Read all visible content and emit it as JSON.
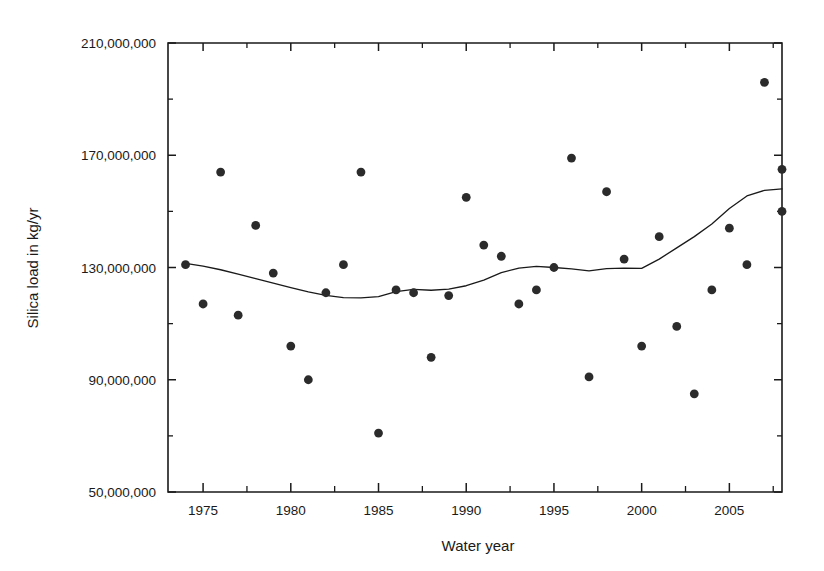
{
  "chart_data": {
    "type": "scatter",
    "title": "",
    "xlabel": "Water year",
    "ylabel": "Silica load in kg/yr",
    "xlim": [
      1973,
      2008
    ],
    "ylim": [
      50000000,
      210000000
    ],
    "grid": false,
    "legend": "none",
    "x_ticks": [
      1975,
      1980,
      1985,
      1990,
      1995,
      2000,
      2005
    ],
    "x_tick_labels": [
      "1975",
      "1980",
      "1985",
      "1990",
      "1995",
      "2000",
      "2005"
    ],
    "x_minor_ticks": [
      1977.5,
      1982.5,
      1987.5,
      1992.5,
      1997.5,
      2002.5,
      2007.5
    ],
    "y_ticks": [
      50000000,
      90000000,
      130000000,
      170000000,
      210000000
    ],
    "y_tick_labels": [
      "50,000,000",
      "90,000,000",
      "130,000,000",
      "170,000,000",
      "210,000,000"
    ],
    "y_minor_ticks": [
      70000000,
      110000000,
      150000000,
      190000000
    ],
    "point_color": "#2b2b2b",
    "line_color": "#1a1a1a",
    "series": [
      {
        "name": "Annual silica load",
        "type": "scatter",
        "points": [
          {
            "x": 1974,
            "y": 131000000
          },
          {
            "x": 1975,
            "y": 117000000
          },
          {
            "x": 1976,
            "y": 164000000
          },
          {
            "x": 1977,
            "y": 113000000
          },
          {
            "x": 1978,
            "y": 145000000
          },
          {
            "x": 1979,
            "y": 128000000
          },
          {
            "x": 1980,
            "y": 102000000
          },
          {
            "x": 1981,
            "y": 90000000
          },
          {
            "x": 1982,
            "y": 121000000
          },
          {
            "x": 1983,
            "y": 131000000
          },
          {
            "x": 1984,
            "y": 164000000
          },
          {
            "x": 1985,
            "y": 71000000
          },
          {
            "x": 1986,
            "y": 122000000
          },
          {
            "x": 1987,
            "y": 121000000
          },
          {
            "x": 1988,
            "y": 98000000
          },
          {
            "x": 1989,
            "y": 120000000
          },
          {
            "x": 1990,
            "y": 155000000
          },
          {
            "x": 1991,
            "y": 138000000
          },
          {
            "x": 1992,
            "y": 134000000
          },
          {
            "x": 1993,
            "y": 117000000
          },
          {
            "x": 1994,
            "y": 122000000
          },
          {
            "x": 1995,
            "y": 130000000
          },
          {
            "x": 1996,
            "y": 169000000
          },
          {
            "x": 1997,
            "y": 91000000
          },
          {
            "x": 1998,
            "y": 157000000
          },
          {
            "x": 1999,
            "y": 133000000
          },
          {
            "x": 2000,
            "y": 102000000
          },
          {
            "x": 2001,
            "y": 141000000
          },
          {
            "x": 2002,
            "y": 109000000
          },
          {
            "x": 2003,
            "y": 85000000
          },
          {
            "x": 2004,
            "y": 122000000
          },
          {
            "x": 2005,
            "y": 144000000
          },
          {
            "x": 2006,
            "y": 131000000
          },
          {
            "x": 2007,
            "y": 196000000
          },
          {
            "x": 2008,
            "y": 150000000
          },
          {
            "x": 2008,
            "y": 165000000
          }
        ]
      },
      {
        "name": "Smoothed trend",
        "type": "line",
        "points": [
          {
            "x": 1974.0,
            "y": 131500000
          },
          {
            "x": 1975.0,
            "y": 130500000
          },
          {
            "x": 1976.0,
            "y": 129200000
          },
          {
            "x": 1977.0,
            "y": 127600000
          },
          {
            "x": 1978.0,
            "y": 126000000
          },
          {
            "x": 1979.0,
            "y": 124400000
          },
          {
            "x": 1980.0,
            "y": 122800000
          },
          {
            "x": 1981.0,
            "y": 121300000
          },
          {
            "x": 1982.0,
            "y": 120100000
          },
          {
            "x": 1983.0,
            "y": 119300000
          },
          {
            "x": 1984.0,
            "y": 119200000
          },
          {
            "x": 1985.0,
            "y": 119600000
          },
          {
            "x": 1986.0,
            "y": 121400000
          },
          {
            "x": 1987.0,
            "y": 122200000
          },
          {
            "x": 1988.0,
            "y": 121900000
          },
          {
            "x": 1989.0,
            "y": 122300000
          },
          {
            "x": 1990.0,
            "y": 123500000
          },
          {
            "x": 1991.0,
            "y": 125500000
          },
          {
            "x": 1992.0,
            "y": 128200000
          },
          {
            "x": 1993.0,
            "y": 129800000
          },
          {
            "x": 1994.0,
            "y": 130400000
          },
          {
            "x": 1995.0,
            "y": 130000000
          },
          {
            "x": 1996.0,
            "y": 129500000
          },
          {
            "x": 1997.0,
            "y": 128800000
          },
          {
            "x": 1998.0,
            "y": 129600000
          },
          {
            "x": 1999.0,
            "y": 129800000
          },
          {
            "x": 2000.0,
            "y": 129700000
          },
          {
            "x": 2001.0,
            "y": 133000000
          },
          {
            "x": 2002.0,
            "y": 137000000
          },
          {
            "x": 2003.0,
            "y": 141000000
          },
          {
            "x": 2004.0,
            "y": 145500000
          },
          {
            "x": 2005.0,
            "y": 151000000
          },
          {
            "x": 2006.0,
            "y": 155500000
          },
          {
            "x": 2007.0,
            "y": 157500000
          },
          {
            "x": 2008.0,
            "y": 158000000
          }
        ]
      }
    ]
  },
  "plot_geometry": {
    "left": 168,
    "top": 43,
    "right": 782,
    "bottom": 492
  }
}
